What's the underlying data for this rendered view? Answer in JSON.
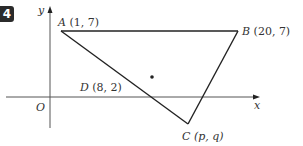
{
  "question_number": "4",
  "axes": {
    "x_label": "x",
    "y_label": "y",
    "origin_label": "O"
  },
  "points": {
    "A": {
      "name": "A",
      "coords": "(1, 7)"
    },
    "B": {
      "name": "B",
      "coords": "(20, 7)"
    },
    "C": {
      "name": "C",
      "coords": "(p, q)"
    },
    "D": {
      "name": "D",
      "coords": "(8, 2)"
    }
  },
  "colors": {
    "line": "#222222",
    "axis": "#555555",
    "badge": "#2b2b2b"
  }
}
